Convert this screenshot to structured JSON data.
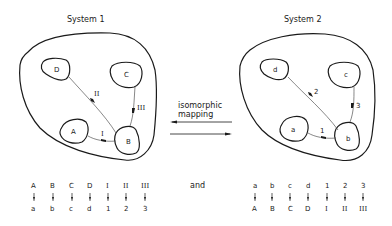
{
  "system1": {
    "title": "System 1",
    "nodes": {
      "A": "A",
      "B": "B",
      "C": "C",
      "D": "D"
    },
    "edges": {
      "I": "I",
      "II": "II",
      "III": "III"
    }
  },
  "system2": {
    "title": "System 2",
    "nodes": {
      "a": "a",
      "b": "b",
      "c": "c",
      "d": "d"
    },
    "edges": {
      "e1": "1",
      "e2": "2",
      "e3": "3"
    }
  },
  "mapping": {
    "line1": "isomorphic",
    "line2": "mapping"
  },
  "conjunction": "and",
  "table1": {
    "top": [
      "A",
      "B",
      "C",
      "D",
      "I",
      "II",
      "III"
    ],
    "bottom": [
      "a",
      "b",
      "c",
      "d",
      "1",
      "2",
      "3"
    ]
  },
  "table2": {
    "top": [
      "a",
      "b",
      "c",
      "d",
      "1",
      "2",
      "3"
    ],
    "bottom": [
      "A",
      "B",
      "C",
      "D",
      "I",
      "II",
      "III"
    ]
  }
}
